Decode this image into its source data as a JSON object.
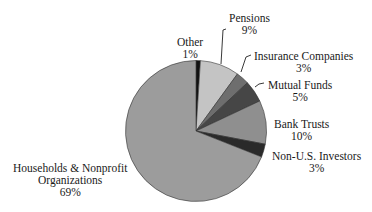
{
  "chart_data": {
    "type": "pie",
    "title": "",
    "start_angle_deg": 0,
    "direction": "clockwise",
    "slices": [
      {
        "label": "Other",
        "value": 1,
        "pct_label": "1%",
        "color": "#111111"
      },
      {
        "label": "Pensions",
        "value": 9,
        "pct_label": "9%",
        "color": "#c4c4c4"
      },
      {
        "label": "Insurance Companies",
        "value": 3,
        "pct_label": "3%",
        "color": "#6e6e6e"
      },
      {
        "label": "Mutual Funds",
        "value": 5,
        "pct_label": "5%",
        "color": "#464646"
      },
      {
        "label": "Bank Trusts",
        "value": 10,
        "pct_label": "10%",
        "color": "#8f8f8f"
      },
      {
        "label": "Non-U.S. Investors",
        "value": 3,
        "pct_label": "3%",
        "color": "#2a2a2a"
      },
      {
        "label": "Households & Nonprofit Organizations",
        "value": 69,
        "pct_label": "69%",
        "color": "#9c9c9c"
      }
    ],
    "legend": "none (direct labels with leader lines)"
  },
  "labels": {
    "other": {
      "line1": "Other",
      "line2": "1%"
    },
    "pensions": {
      "line1": "Pensions",
      "line2": "9%"
    },
    "insurance": {
      "line1": "Insurance Companies",
      "line2": "3%"
    },
    "mutual": {
      "line1": "Mutual Funds",
      "line2": "5%"
    },
    "bank": {
      "line1": "Bank Trusts",
      "line2": "10%"
    },
    "nonus": {
      "line1": "Non-U.S. Investors",
      "line2": "3%"
    },
    "households": {
      "line1": "Households & Nonprofit",
      "line2": "Organizations",
      "line3": "69%"
    }
  }
}
